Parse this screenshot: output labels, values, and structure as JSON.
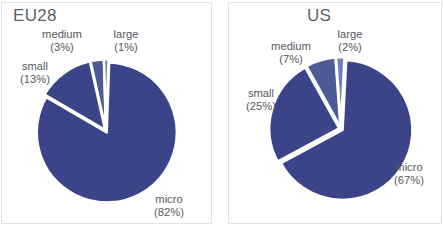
{
  "figure": {
    "background": "#ffffff",
    "panel_border_color": "#e3e3e6",
    "label_color": "#58585d",
    "title_color": "#5f5f64"
  },
  "palette": {
    "micro": "#3b4488",
    "small": "#3b4488",
    "medium": "#4e5a96",
    "large": "#7080b8",
    "slice_gap": "#ffffff"
  },
  "chart_data": [
    {
      "type": "pie",
      "title": "EU28",
      "labels": [
        "micro",
        "small",
        "medium",
        "large"
      ],
      "values": [
        82,
        13,
        3,
        1
      ],
      "value_unit": "%",
      "colors": [
        "#3b4488",
        "#3b4488",
        "#4e5a96",
        "#7080b8"
      ],
      "legend": "none",
      "annotations": [
        {
          "name": "micro",
          "label": "micro",
          "value": "(82%)"
        },
        {
          "name": "small",
          "label": "small",
          "value": "(13%)"
        },
        {
          "name": "medium",
          "label": "medium",
          "value": "(3%)"
        },
        {
          "name": "large",
          "label": "large",
          "value": "(1%)"
        }
      ]
    },
    {
      "type": "pie",
      "title": "US",
      "labels": [
        "micro",
        "small",
        "medium",
        "large"
      ],
      "values": [
        67,
        25,
        7,
        2
      ],
      "value_unit": "%",
      "colors": [
        "#3b4488",
        "#3b4488",
        "#4e5a96",
        "#7080b8"
      ],
      "legend": "none",
      "annotations": [
        {
          "name": "micro",
          "label": "micro",
          "value": "(67%)"
        },
        {
          "name": "small",
          "label": "small",
          "value": "(25%)"
        },
        {
          "name": "medium",
          "label": "medium",
          "value": "(7%)"
        },
        {
          "name": "large",
          "label": "large",
          "value": "(2%)"
        }
      ]
    }
  ]
}
